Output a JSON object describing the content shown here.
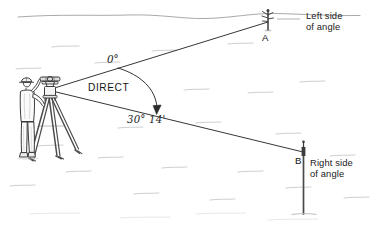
{
  "diagram": {
    "mode_label": "DIRECT",
    "zero_reference": "0°",
    "angle_value": "30° 14'",
    "stations": [
      {
        "id": "A",
        "label": "A",
        "side_label_line1": "Left side",
        "side_label_line2": "of angle"
      },
      {
        "id": "B",
        "label": "B",
        "side_label_line1": "Right side",
        "side_label_line2": "of angle"
      }
    ],
    "instrument": {
      "name": "theodolite-transit-on-tripod",
      "operator": "surveyor"
    },
    "colors": {
      "ink": "#1a1a1a",
      "line": "#2a2a2a",
      "ground_texture": "#b9b9b9",
      "horizon": "#8d8d8d",
      "background": "#ffffff"
    },
    "geometry": {
      "vertex": {
        "x": 48,
        "y": 90
      },
      "point_a": {
        "x": 268,
        "y": 22
      },
      "point_b": {
        "x": 303,
        "y": 152
      }
    }
  }
}
